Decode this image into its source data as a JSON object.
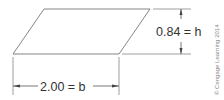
{
  "diagram": {
    "shape": "parallelogram",
    "height_label": "0.84 = h",
    "base_label": "2.00 = b",
    "copyright": "© Cengage Learning 2014",
    "colors": {
      "line": "#555555",
      "text": "#333333",
      "copyright": "#888888"
    }
  }
}
